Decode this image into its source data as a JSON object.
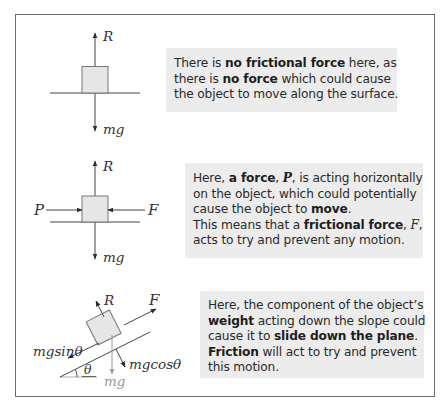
{
  "panels": [
    {
      "id": "no-friction",
      "diagram": {
        "labels": {
          "up": "R",
          "down": "mg"
        }
      },
      "text": {
        "lines": [
          [
            {
              "t": "There is "
            },
            {
              "t": "no frictional force",
              "b": true
            },
            {
              "t": " here, as"
            }
          ],
          [
            {
              "t": "there is "
            },
            {
              "t": "no force",
              "b": true
            },
            {
              "t": " which could cause"
            }
          ],
          [
            {
              "t": "the object to move along the surface."
            }
          ]
        ]
      }
    },
    {
      "id": "horizontal-force",
      "diagram": {
        "labels": {
          "up": "R",
          "down": "mg",
          "left": "P",
          "right": "F"
        }
      },
      "text": {
        "lines": [
          [
            {
              "t": "Here, "
            },
            {
              "t": "a force",
              "b": true
            },
            {
              "t": ", "
            },
            {
              "t": "P",
              "b": true,
              "i": true
            },
            {
              "t": ", is acting horizontally"
            }
          ],
          [
            {
              "t": "on the object, which could potentially"
            }
          ],
          [
            {
              "t": "cause the object to "
            },
            {
              "t": "move",
              "b": true
            },
            {
              "t": "."
            }
          ],
          [
            {
              "t": "This means that a "
            },
            {
              "t": "frictional force",
              "b": true
            },
            {
              "t": ", "
            },
            {
              "t": "F",
              "i": true
            },
            {
              "t": ","
            }
          ],
          [
            {
              "t": "acts to try and prevent any motion."
            }
          ]
        ]
      }
    },
    {
      "id": "inclined-plane",
      "diagram": {
        "labels": {
          "normal": "R",
          "friction": "F",
          "parallel": "mgsinθ",
          "perpendicular": "mgcosθ",
          "weight": "mg",
          "angle": "θ"
        }
      },
      "text": {
        "lines": [
          [
            {
              "t": "Here, the component of the object’s"
            }
          ],
          [
            {
              "t": "weight",
              "b": true
            },
            {
              "t": " acting down the slope could"
            }
          ],
          [
            {
              "t": "cause it to "
            },
            {
              "t": "slide down the plane",
              "b": true
            },
            {
              "t": "."
            }
          ],
          [
            {
              "t": "Friction",
              "b": true
            },
            {
              "t": " will act to try and prevent"
            }
          ],
          [
            {
              "t": "this motion."
            }
          ]
        ]
      }
    }
  ],
  "colors": {
    "frame": "#6a6a6a",
    "textbox_bg": "#ececec",
    "block_fill": "#e6e6e6",
    "block_stroke": "#777777",
    "line": "#333333",
    "weight_grey": "#9a9a9a"
  }
}
